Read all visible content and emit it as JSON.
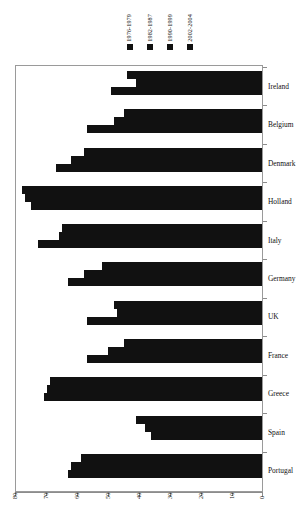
{
  "chart_data": {
    "type": "bar",
    "orientation": "horizontal",
    "title": "",
    "xlabel": "",
    "ylabel": "",
    "xlim": [
      80,
      0
    ],
    "x_reversed": true,
    "xticks": [
      80,
      70,
      60,
      50,
      40,
      30,
      20,
      10,
      0
    ],
    "grid": false,
    "legend_position": "top",
    "categories": [
      "Ireland",
      "Belgium",
      "Denmark",
      "Holland",
      "Italy",
      "Germany",
      "UK",
      "France",
      "Greece",
      "Spain",
      "Portugal"
    ],
    "series": [
      {
        "name": "1976-1979",
        "color": "#111111",
        "values": [
          44,
          45,
          58,
          78,
          65,
          52,
          48,
          45,
          69,
          41,
          59
        ]
      },
      {
        "name": "1982-1987",
        "color": "#111111",
        "values": [
          41,
          48,
          62,
          77,
          66,
          58,
          47,
          50,
          70,
          38,
          62
        ]
      },
      {
        "name": "1990-1999",
        "color": "#111111",
        "values": [
          49,
          57,
          67,
          75,
          73,
          63,
          57,
          57,
          71,
          36,
          63
        ]
      },
      {
        "name": "2002-2004",
        "color": "#111111",
        "values": [
          0,
          0,
          0,
          0,
          0,
          0,
          0,
          0,
          0,
          0,
          0
        ]
      }
    ]
  },
  "legend": {
    "items": [
      {
        "label": "1976-1979",
        "swatch": "legend-swatch-1"
      },
      {
        "label": "1982-1987",
        "swatch": "legend-swatch-2"
      },
      {
        "label": "1990-1999",
        "swatch": "legend-swatch-3"
      },
      {
        "label": "2002-2004",
        "swatch": "legend-swatch-4"
      }
    ]
  },
  "axis": {
    "x_tick_labels": [
      "80",
      "70",
      "60",
      "50",
      "40",
      "30",
      "20",
      "10",
      "0"
    ],
    "y_tick_labels": [
      "Ireland",
      "Belgium",
      "Denmark",
      "Holland",
      "Italy",
      "Germany",
      "UK",
      "France",
      "Greece",
      "Spain",
      "Portugal"
    ]
  },
  "colors": {
    "bar": "#111111",
    "frame": "#9a9a9a",
    "background": "#ffffff",
    "text": "#111111"
  }
}
